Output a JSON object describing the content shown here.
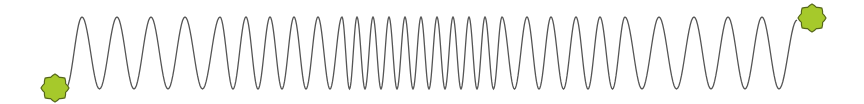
{
  "diagram": {
    "type": "spring-wave",
    "colors": {
      "background": "#ffffff",
      "wave_stroke": "#555555",
      "anchor_fill": "#a6c92b",
      "anchor_stroke": "#55661a"
    },
    "wave": {
      "start": [
        66,
        88
      ],
      "end": [
        797,
        20
      ],
      "peak_y": 17,
      "trough_y": 89,
      "peak_x": [
        82,
        117,
        151,
        185,
        220,
        246,
        270,
        294,
        318,
        342,
        357,
        373,
        389,
        405,
        421,
        437,
        453,
        469,
        485,
        502,
        527,
        551,
        576,
        600,
        625,
        659,
        694,
        728,
        762
      ]
    },
    "anchors": [
      {
        "name": "left-anchor",
        "cx": 55,
        "cy": 88,
        "r": 14,
        "points": 8
      },
      {
        "name": "right-anchor",
        "cx": 812,
        "cy": 18,
        "r": 14,
        "points": 8
      }
    ]
  }
}
